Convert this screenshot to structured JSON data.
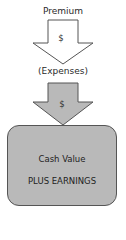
{
  "diagram": {
    "top_label": "Premium",
    "arrow1": {
      "symbol": "$",
      "fill": "#ffffff",
      "stroke": "#555555"
    },
    "middle_label": "(Expenses)",
    "arrow2": {
      "symbol": "$",
      "fill": "#b9b9b9",
      "stroke": "#555555"
    },
    "box": {
      "line1": "Cash Value",
      "line2": "PLUS EARNINGS",
      "fill": "#b9b9b9"
    }
  }
}
